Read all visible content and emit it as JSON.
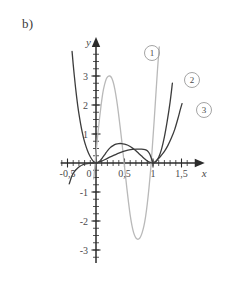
{
  "figure": {
    "panel_label": "b)",
    "background_color": "#ffffff"
  },
  "axes": {
    "x_axis_name": "x",
    "y_axis_name": "y",
    "axis_color": "#2b2b2b",
    "origin_px": {
      "x": 96,
      "y": 163
    },
    "unit_px": {
      "x": 57,
      "y": 29
    },
    "x_tick_labels": [
      "-0,5",
      "0",
      "0,5",
      "1",
      "1,5"
    ],
    "x_tick_values": [
      -0.5,
      0,
      0.5,
      1,
      1.5
    ],
    "y_tick_labels": [
      "3",
      "2",
      "1",
      "0",
      "-1",
      "-2",
      "-3"
    ],
    "y_tick_values": [
      3,
      2,
      1,
      0,
      -1,
      -2,
      -3
    ],
    "x_minor_step": 0.1,
    "y_minor_step": 0.25,
    "x_range": [
      -0.62,
      1.68
    ],
    "y_range": [
      -3.45,
      3.9
    ],
    "grid": false
  },
  "chart_data": {
    "type": "line",
    "title": "b)",
    "xlabel": "x",
    "ylabel": "y",
    "xlim": [
      -0.62,
      1.68
    ],
    "ylim": [
      -3.45,
      3.9
    ],
    "grid": false,
    "legend_position": "inline-right",
    "series": [
      {
        "name": "1",
        "tag": "1",
        "color": "#b9b9b9",
        "width": 1.3,
        "tag_px": {
          "x": 152,
          "y": 53
        },
        "annotation": "oscillating polynomial: maximum near (0,25; 3), zero near x = 0,5, minimum near (0,85; -2,5), steep rise through x = 1",
        "points": [
          [
            -0.04,
            -0.55
          ],
          [
            -0.02,
            -0.1
          ],
          [
            0.0,
            0.35
          ],
          [
            0.03,
            0.95
          ],
          [
            0.06,
            1.5
          ],
          [
            0.09,
            2.0
          ],
          [
            0.12,
            2.42
          ],
          [
            0.15,
            2.7
          ],
          [
            0.18,
            2.9
          ],
          [
            0.21,
            2.98
          ],
          [
            0.24,
            3.0
          ],
          [
            0.27,
            2.95
          ],
          [
            0.3,
            2.8
          ],
          [
            0.33,
            2.55
          ],
          [
            0.36,
            2.2
          ],
          [
            0.39,
            1.78
          ],
          [
            0.42,
            1.3
          ],
          [
            0.45,
            0.8
          ],
          [
            0.48,
            0.25
          ],
          [
            0.51,
            -0.3
          ],
          [
            0.54,
            -0.85
          ],
          [
            0.57,
            -1.35
          ],
          [
            0.6,
            -1.8
          ],
          [
            0.63,
            -2.15
          ],
          [
            0.66,
            -2.4
          ],
          [
            0.69,
            -2.55
          ],
          [
            0.72,
            -2.62
          ],
          [
            0.75,
            -2.62
          ],
          [
            0.78,
            -2.55
          ],
          [
            0.81,
            -2.4
          ],
          [
            0.84,
            -2.18
          ],
          [
            0.87,
            -1.85
          ],
          [
            0.9,
            -1.4
          ],
          [
            0.93,
            -0.85
          ],
          [
            0.96,
            -0.2
          ],
          [
            0.99,
            0.6
          ],
          [
            1.02,
            1.45
          ],
          [
            1.05,
            2.35
          ],
          [
            1.08,
            3.25
          ],
          [
            1.11,
            4.0
          ]
        ]
      },
      {
        "name": "2",
        "tag": "2",
        "color": "#3c3c3c",
        "width": 1.3,
        "tag_px": {
          "x": 192,
          "y": 80
        },
        "annotation": "steep descending branch from the upper left to the origin, low hump of about 0,65 near x = 0,5, tangent touch of the x-axis at x = 1, steep rise to about 2,5 at x = 1,35",
        "points": [
          [
            -0.42,
            3.85
          ],
          [
            -0.4,
            3.4
          ],
          [
            -0.38,
            3.0
          ],
          [
            -0.36,
            2.62
          ],
          [
            -0.34,
            2.28
          ],
          [
            -0.32,
            1.97
          ],
          [
            -0.3,
            1.7
          ],
          [
            -0.27,
            1.35
          ],
          [
            -0.24,
            1.05
          ],
          [
            -0.21,
            0.8
          ],
          [
            -0.18,
            0.6
          ],
          [
            -0.15,
            0.43
          ],
          [
            -0.12,
            0.29
          ],
          [
            -0.09,
            0.18
          ],
          [
            -0.06,
            0.09
          ],
          [
            -0.03,
            0.03
          ],
          [
            0.0,
            0.0
          ],
          [
            0.04,
            0.03
          ],
          [
            0.08,
            0.1
          ],
          [
            0.12,
            0.2
          ],
          [
            0.16,
            0.31
          ],
          [
            0.2,
            0.42
          ],
          [
            0.25,
            0.53
          ],
          [
            0.3,
            0.6
          ],
          [
            0.35,
            0.65
          ],
          [
            0.4,
            0.67
          ],
          [
            0.45,
            0.67
          ],
          [
            0.5,
            0.65
          ],
          [
            0.55,
            0.62
          ],
          [
            0.6,
            0.57
          ],
          [
            0.65,
            0.5
          ],
          [
            0.7,
            0.42
          ],
          [
            0.75,
            0.33
          ],
          [
            0.8,
            0.24
          ],
          [
            0.85,
            0.15
          ],
          [
            0.9,
            0.07
          ],
          [
            0.95,
            0.02
          ],
          [
            1.0,
            0.0
          ],
          [
            1.05,
            0.05
          ],
          [
            1.1,
            0.2
          ],
          [
            1.15,
            0.48
          ],
          [
            1.2,
            0.9
          ],
          [
            1.25,
            1.45
          ],
          [
            1.3,
            2.1
          ],
          [
            1.34,
            2.75
          ]
        ]
      },
      {
        "name": "3",
        "tag": "3",
        "color": "#3c3c3c",
        "width": 1.3,
        "tag_px": {
          "x": 204,
          "y": 110
        },
        "annotation": "small branch below the axis on the left, slow rise through the origin region, tangent touch of the x-axis at x = 1, gentle rise to about 2 at x = 1,5",
        "points": [
          [
            -0.47,
            -0.72
          ],
          [
            -0.45,
            -0.6
          ],
          [
            -0.43,
            -0.48
          ],
          [
            -0.4,
            -0.36
          ],
          [
            -0.36,
            -0.25
          ],
          [
            -0.32,
            -0.17
          ],
          [
            -0.28,
            -0.11
          ],
          [
            -0.24,
            -0.07
          ],
          [
            -0.2,
            -0.04
          ],
          [
            -0.15,
            -0.02
          ],
          [
            -0.1,
            -0.01
          ],
          [
            -0.05,
            0.0
          ],
          [
            0.0,
            0.0
          ],
          [
            0.08,
            0.05
          ],
          [
            0.16,
            0.12
          ],
          [
            0.24,
            0.2
          ],
          [
            0.32,
            0.27
          ],
          [
            0.4,
            0.34
          ],
          [
            0.48,
            0.4
          ],
          [
            0.56,
            0.44
          ],
          [
            0.64,
            0.47
          ],
          [
            0.72,
            0.48
          ],
          [
            0.8,
            0.48
          ],
          [
            0.86,
            0.46
          ],
          [
            0.9,
            0.42
          ],
          [
            0.94,
            0.32
          ],
          [
            0.97,
            0.17
          ],
          [
            1.0,
            0.0
          ],
          [
            1.04,
            0.04
          ],
          [
            1.08,
            0.12
          ],
          [
            1.14,
            0.25
          ],
          [
            1.2,
            0.4
          ],
          [
            1.26,
            0.6
          ],
          [
            1.32,
            0.85
          ],
          [
            1.38,
            1.15
          ],
          [
            1.44,
            1.55
          ],
          [
            1.48,
            1.85
          ],
          [
            1.51,
            2.05
          ]
        ]
      }
    ]
  }
}
